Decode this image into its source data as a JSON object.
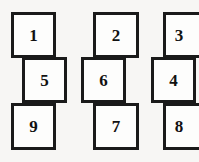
{
  "diagram": {
    "type": "offset-square-stacks",
    "canvas": {
      "width": 199,
      "height": 162
    },
    "style": {
      "background_color": "#f7f6f4",
      "box_fill_color": "#fdfdfc",
      "box_border_color": "#1a1a1a",
      "label_color": "#111111",
      "border_width_px": 3
    },
    "columns": [
      {
        "name": "column-left",
        "boxes": [
          {
            "label": "1",
            "row": "top",
            "x": 11,
            "y": 12,
            "w": 45,
            "h": 46,
            "offset": "left-aligned"
          },
          {
            "label": "5",
            "row": "middle",
            "x": 22,
            "y": 57,
            "w": 45,
            "h": 46,
            "offset": "shifted-right"
          },
          {
            "label": "9",
            "row": "bottom",
            "x": 11,
            "y": 103,
            "w": 45,
            "h": 47,
            "offset": "left-aligned"
          }
        ]
      },
      {
        "name": "column-middle",
        "boxes": [
          {
            "label": "2",
            "row": "top",
            "x": 93,
            "y": 12,
            "w": 46,
            "h": 46,
            "offset": "right-aligned"
          },
          {
            "label": "6",
            "row": "middle",
            "x": 81,
            "y": 57,
            "w": 45,
            "h": 46,
            "offset": "shifted-left"
          },
          {
            "label": "7",
            "row": "bottom",
            "x": 93,
            "y": 103,
            "w": 46,
            "h": 47,
            "offset": "right-aligned"
          }
        ]
      },
      {
        "name": "column-right",
        "boxes": [
          {
            "label": "3",
            "row": "top",
            "x": 163,
            "y": 12,
            "w": 46,
            "h": 46,
            "offset": "right-aligned-cropped"
          },
          {
            "label": "4",
            "row": "middle",
            "x": 151,
            "y": 57,
            "w": 45,
            "h": 46,
            "offset": "shifted-left"
          },
          {
            "label": "8",
            "row": "bottom",
            "x": 163,
            "y": 103,
            "w": 46,
            "h": 47,
            "offset": "right-aligned-cropped"
          }
        ]
      }
    ]
  }
}
